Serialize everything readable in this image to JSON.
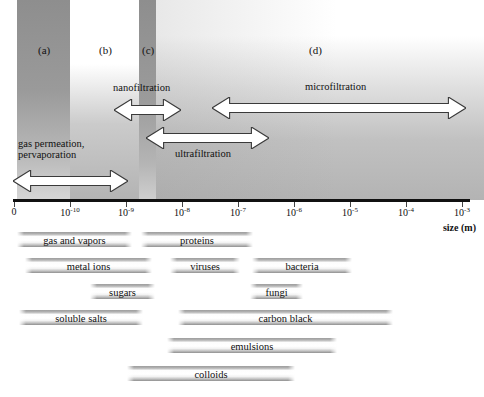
{
  "chart_data": {
    "type": "bar",
    "xlabel": "size (m)",
    "scale": "log",
    "axis": {
      "ticks": [
        {
          "label": "0",
          "sup": "",
          "x": 14
        },
        {
          "label": "10",
          "sup": "-10",
          "x": 70
        },
        {
          "label": "10",
          "sup": "-9",
          "x": 126
        },
        {
          "label": "10",
          "sup": "-8",
          "x": 182
        },
        {
          "label": "10",
          "sup": "-7",
          "x": 238
        },
        {
          "label": "10",
          "sup": "-6",
          "x": 294
        },
        {
          "label": "10",
          "sup": "-5",
          "x": 350
        },
        {
          "label": "10",
          "sup": "-4",
          "x": 406
        },
        {
          "label": "10",
          "sup": "-3",
          "x": 462
        }
      ]
    },
    "zones": [
      {
        "id": "a",
        "label": "(a)",
        "x": 38,
        "y": 44
      },
      {
        "id": "b",
        "label": "(b)",
        "x": 99,
        "y": 44
      },
      {
        "id": "c",
        "label": "(c)",
        "x": 142,
        "y": 44
      },
      {
        "id": "d",
        "label": "(d)",
        "x": 309,
        "y": 44
      }
    ],
    "processes": [
      {
        "name": "gas permeation, pervaporation",
        "label_lines": [
          "gas permeation,",
          "pervaporation"
        ],
        "x1": 13,
        "x2": 128,
        "y": 170,
        "label_x": 18,
        "label_y": 138
      },
      {
        "name": "nanofiltration",
        "label_lines": [
          "nanofiltration"
        ],
        "x1": 114,
        "x2": 181,
        "y": 99,
        "label_x": 113,
        "label_y": 82
      },
      {
        "name": "ultrafiltration",
        "label_lines": [
          "ultrafiltration"
        ],
        "x1": 146,
        "x2": 269,
        "y": 127,
        "label_x": 175,
        "label_y": 148
      },
      {
        "name": "microfiltration",
        "label_lines": [
          "microfiltration"
        ],
        "x1": 212,
        "x2": 466,
        "y": 97,
        "label_x": 305,
        "label_y": 81
      }
    ],
    "materials": [
      {
        "label": "gas and vapors",
        "x1": 17,
        "x2": 132,
        "y": 232
      },
      {
        "label": "proteins",
        "x1": 141,
        "x2": 253,
        "y": 232
      },
      {
        "label": "metal ions",
        "x1": 25,
        "x2": 152,
        "y": 258
      },
      {
        "label": "viruses",
        "x1": 170,
        "x2": 240,
        "y": 258
      },
      {
        "label": "bacteria",
        "x1": 252,
        "x2": 352,
        "y": 258
      },
      {
        "label": "sugars",
        "x1": 90,
        "x2": 155,
        "y": 284
      },
      {
        "label": "fungi",
        "x1": 250,
        "x2": 303,
        "y": 284
      },
      {
        "label": "soluble salts",
        "x1": 19,
        "x2": 143,
        "y": 310
      },
      {
        "label": "carbon black",
        "x1": 178,
        "x2": 393,
        "y": 310
      },
      {
        "label": "emulsions",
        "x1": 167,
        "x2": 337,
        "y": 338
      },
      {
        "label": "colloids",
        "x1": 127,
        "x2": 295,
        "y": 366
      }
    ],
    "colors": {
      "band": "#8e8e8e",
      "axis": "#111111",
      "arrow_fill": "#ffffff",
      "arrow_stroke": "#333333",
      "bar_highlight": "#ffffff",
      "bar_shadow": "#8f8f8f"
    }
  }
}
